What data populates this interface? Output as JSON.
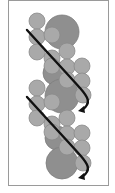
{
  "figure": {
    "width": 115,
    "height": 193,
    "frame": {
      "x": 8.5,
      "y": 0.5,
      "w": 100,
      "h": 185,
      "stroke": "#9a9a9a",
      "fill": "#ffffff"
    },
    "colors": {
      "small_fill": "#a9a9a9",
      "small_stroke": "#8a8a8a",
      "large_fill": "#8f8f8f",
      "large_stroke": "#7e7e7e",
      "arrow": "#111111"
    },
    "large_circles": [
      {
        "cx": 62,
        "cy": 32,
        "r": 17
      },
      {
        "cx": 55,
        "cy": 73,
        "r": 12
      },
      {
        "cx": 62,
        "cy": 96,
        "r": 17
      },
      {
        "cx": 57,
        "cy": 138,
        "r": 12
      },
      {
        "cx": 62,
        "cy": 163,
        "r": 16
      }
    ],
    "small_circles": [
      {
        "cx": 37,
        "cy": 21,
        "r": 8
      },
      {
        "cx": 37,
        "cy": 37,
        "r": 8
      },
      {
        "cx": 52,
        "cy": 35,
        "r": 8
      },
      {
        "cx": 37,
        "cy": 52,
        "r": 8
      },
      {
        "cx": 52,
        "cy": 58,
        "r": 8
      },
      {
        "cx": 67,
        "cy": 51,
        "r": 8
      },
      {
        "cx": 52,
        "cy": 66,
        "r": 8
      },
      {
        "cx": 67,
        "cy": 67,
        "r": 8
      },
      {
        "cx": 82,
        "cy": 66,
        "r": 8
      },
      {
        "cx": 67,
        "cy": 80,
        "r": 8
      },
      {
        "cx": 82,
        "cy": 81,
        "r": 8
      },
      {
        "cx": 83,
        "cy": 95,
        "r": 8
      },
      {
        "cx": 37,
        "cy": 88,
        "r": 8
      },
      {
        "cx": 37,
        "cy": 104,
        "r": 8
      },
      {
        "cx": 52,
        "cy": 102,
        "r": 8
      },
      {
        "cx": 37,
        "cy": 118,
        "r": 8
      },
      {
        "cx": 52,
        "cy": 124,
        "r": 8
      },
      {
        "cx": 67,
        "cy": 118,
        "r": 8
      },
      {
        "cx": 52,
        "cy": 132,
        "r": 8
      },
      {
        "cx": 67,
        "cy": 134,
        "r": 8
      },
      {
        "cx": 82,
        "cy": 133,
        "r": 8
      },
      {
        "cx": 67,
        "cy": 147,
        "r": 8
      },
      {
        "cx": 82,
        "cy": 148,
        "r": 8
      },
      {
        "cx": 83,
        "cy": 163,
        "r": 8
      }
    ],
    "arrows": [
      {
        "name": "helix-arrow-top",
        "d": "M27,30 C45,50 62,68 80,88 C88,97 92,103 82,110"
      },
      {
        "name": "helix-arrow-bottom",
        "d": "M27,97 C45,117 62,135 80,155 C88,164 92,170 82,177"
      }
    ],
    "arrowheads": [
      {
        "name": "helix-arrowhead-top",
        "points": "84,106 78,111 85,113"
      },
      {
        "name": "helix-arrowhead-bottom",
        "points": "84,173 78,178 85,180"
      }
    ]
  }
}
